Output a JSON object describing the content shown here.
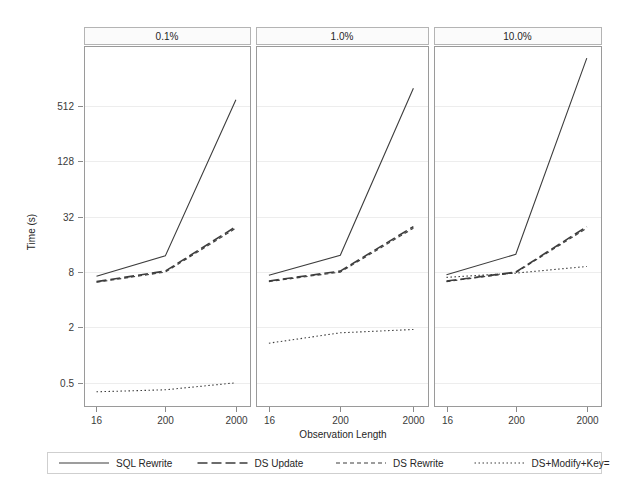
{
  "chart_data": {
    "type": "line",
    "title": "",
    "xlabel": "Observation Length",
    "ylabel": "Time (s)",
    "yscale": "log",
    "ylim": [
      0.28,
      2300
    ],
    "grid": true,
    "legend_position": "bottom",
    "categories": [
      "16",
      "200",
      "2000"
    ],
    "x": [
      16,
      200,
      2000
    ],
    "panel_variable": "Update Percentage",
    "panels": [
      {
        "label": "0.1%",
        "series": [
          {
            "name": "SQL Rewrite",
            "values": [
              7.2,
              12.0,
              600.0
            ]
          },
          {
            "name": "DS Update",
            "values": [
              6.3,
              8.2,
              25.0
            ]
          },
          {
            "name": "DS Rewrite",
            "values": [
              6.2,
              8.0,
              24.0
            ]
          },
          {
            "name": "DS+Modify+Key=",
            "values": [
              0.4,
              0.42,
              0.5
            ]
          }
        ]
      },
      {
        "label": "1.0%",
        "series": [
          {
            "name": "SQL Rewrite",
            "values": [
              7.4,
              12.2,
              800.0
            ]
          },
          {
            "name": "DS Update",
            "values": [
              6.4,
              8.2,
              25.0
            ]
          },
          {
            "name": "DS Rewrite",
            "values": [
              6.3,
              8.0,
              24.0
            ]
          },
          {
            "name": "DS+Modify+Key=",
            "values": [
              1.35,
              1.75,
              1.9
            ]
          }
        ]
      },
      {
        "label": "10.0%",
        "series": [
          {
            "name": "SQL Rewrite",
            "values": [
              7.5,
              12.5,
              1700.0
            ]
          },
          {
            "name": "DS Update",
            "values": [
              6.4,
              8.0,
              25.0
            ]
          },
          {
            "name": "DS Rewrite",
            "values": [
              6.3,
              7.9,
              24.0
            ]
          },
          {
            "name": "DS+Modify+Key=",
            "values": [
              7.0,
              7.8,
              9.2
            ]
          }
        ]
      }
    ],
    "ytick_values": [
      0.5,
      2,
      8,
      32,
      128,
      512
    ],
    "ytick_labels": [
      "0.5",
      "2",
      "8",
      "32",
      "128",
      "512"
    ],
    "xtick_labels": [
      "16",
      "200",
      "2000"
    ],
    "series_styles": [
      {
        "name": "SQL Rewrite",
        "dash": "none",
        "width": 1.1,
        "color": "#3d3d3d"
      },
      {
        "name": "DS Update",
        "dash": "10,4",
        "width": 1.6,
        "color": "#3d3d3d"
      },
      {
        "name": "DS Rewrite",
        "dash": "4,3",
        "width": 1.1,
        "color": "#3d3d3d"
      },
      {
        "name": "DS+Modify+Key=",
        "dash": "1.5,2.5",
        "width": 1.1,
        "color": "#3d3d3d"
      }
    ]
  },
  "legend": {
    "entries": [
      {
        "label": "SQL Rewrite",
        "style": "solid"
      },
      {
        "label": "DS Update",
        "style": "long-dash"
      },
      {
        "label": "DS Rewrite",
        "style": "short-dash"
      },
      {
        "label": "DS+Modify+Key=",
        "style": "dotted"
      }
    ]
  },
  "axes": {
    "x_title": "Observation Length",
    "y_title": "Time (s)"
  },
  "colors": {
    "background": "#ffffff",
    "line": "#3d3d3d",
    "frame": "#9a9a9a",
    "grid": "#ededed",
    "text": "#262626"
  }
}
